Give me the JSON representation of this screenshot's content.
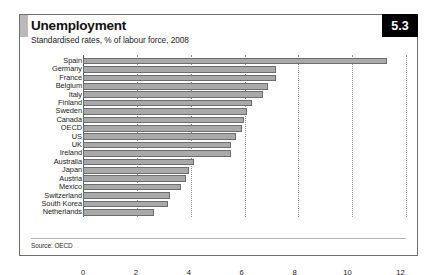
{
  "figure": {
    "title": "Unemployment",
    "subtitle": "Standardised rates, % of labour force, 2008",
    "badge": "5.3",
    "source": "Source: OECD",
    "accent_color": "#000000",
    "bar_color": "#a9a9a9",
    "bar_border_color": "#6d6d6d"
  },
  "chart_data": {
    "type": "bar",
    "orientation": "horizontal",
    "title": "Unemployment",
    "subtitle": "Standardised rates, % of labour force, 2008",
    "xlabel": "",
    "ylabel": "",
    "xlim": [
      0,
      12.4
    ],
    "xticks": [
      0,
      2,
      4,
      6,
      8,
      10,
      12
    ],
    "xtick_labels": [
      "0",
      "2",
      "4",
      "6",
      "8",
      "10",
      "12"
    ],
    "grid": true,
    "legend": "none",
    "categories": [
      "Spain",
      "Germany",
      "France",
      "Belgium",
      "Italy",
      "Finland",
      "Sweden",
      "Canada",
      "OECD",
      "US",
      "UK",
      "Ireland",
      "Australia",
      "Japan",
      "Austria",
      "Mexico",
      "Switzerland",
      "South Korea",
      "Netherlands"
    ],
    "values": [
      11.5,
      7.3,
      7.3,
      7.0,
      6.8,
      6.4,
      6.2,
      6.1,
      6.0,
      5.8,
      5.6,
      5.6,
      4.2,
      4.0,
      3.9,
      3.7,
      3.3,
      3.2,
      2.7
    ],
    "units": "% of labour force"
  }
}
